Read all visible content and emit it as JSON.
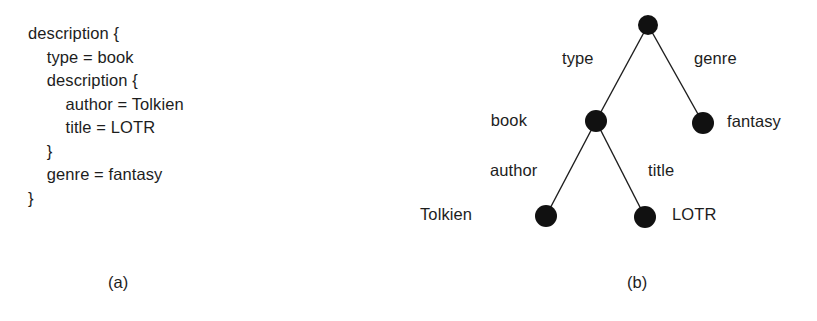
{
  "figure": {
    "background_color": "#ffffff",
    "ink_color": "#1d1d1d",
    "node_color": "#111111"
  },
  "panel_a": {
    "caption": "(a)",
    "code_lines": [
      "description {",
      "    type = book",
      "    description {",
      "        author = Tolkien",
      "        title = LOTR",
      "    }",
      "    genre = fantasy",
      "}"
    ]
  },
  "panel_b": {
    "caption": "(b)",
    "tree": {
      "nodes": [
        {
          "id": "root",
          "label": "",
          "cx": 228,
          "cy": 25,
          "r": 10,
          "label_x": 0,
          "label_y": 0,
          "label_align": "none"
        },
        {
          "id": "book",
          "label": "book",
          "cx": 176,
          "cy": 121,
          "r": 11,
          "label_x": 107,
          "label_y": 111,
          "label_align": "right"
        },
        {
          "id": "fantasy",
          "label": "fantasy",
          "cx": 283,
          "cy": 123,
          "r": 11,
          "label_x": 307,
          "label_y": 112,
          "label_align": "left"
        },
        {
          "id": "tolkien",
          "label": "Tolkien",
          "cx": 126,
          "cy": 216,
          "r": 11,
          "label_x": 32,
          "label_y": 205,
          "label_align": "right"
        },
        {
          "id": "lotr",
          "label": "LOTR",
          "cx": 225,
          "cy": 217,
          "r": 11,
          "label_x": 252,
          "label_y": 205,
          "label_align": "left"
        }
      ],
      "edges": [
        {
          "from": "root",
          "to": "book",
          "label": "type",
          "label_x": 142,
          "label_y": 49
        },
        {
          "from": "root",
          "to": "fantasy",
          "label": "genre",
          "label_x": 274,
          "label_y": 49
        },
        {
          "from": "book",
          "to": "tolkien",
          "label": "author",
          "label_x": 70,
          "label_y": 161
        },
        {
          "from": "book",
          "to": "lotr",
          "label": "title",
          "label_x": 228,
          "label_y": 161
        }
      ]
    }
  }
}
